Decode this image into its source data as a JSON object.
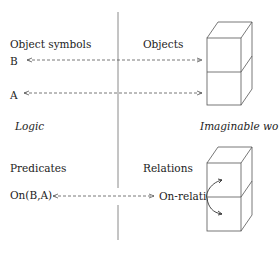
{
  "left_side": {
    "header": "Object symbols",
    "symbols": [
      "B",
      "A"
    ],
    "section_title": "Logic",
    "predicates_header": "Predicates",
    "predicate": "On(B,A)"
  },
  "right_side": {
    "header": "Objects",
    "section_title": "Imaginable world",
    "relations_header": "Relations",
    "relation": "On-relation"
  },
  "colors": {
    "line": "#555555",
    "divider": "#888888"
  }
}
